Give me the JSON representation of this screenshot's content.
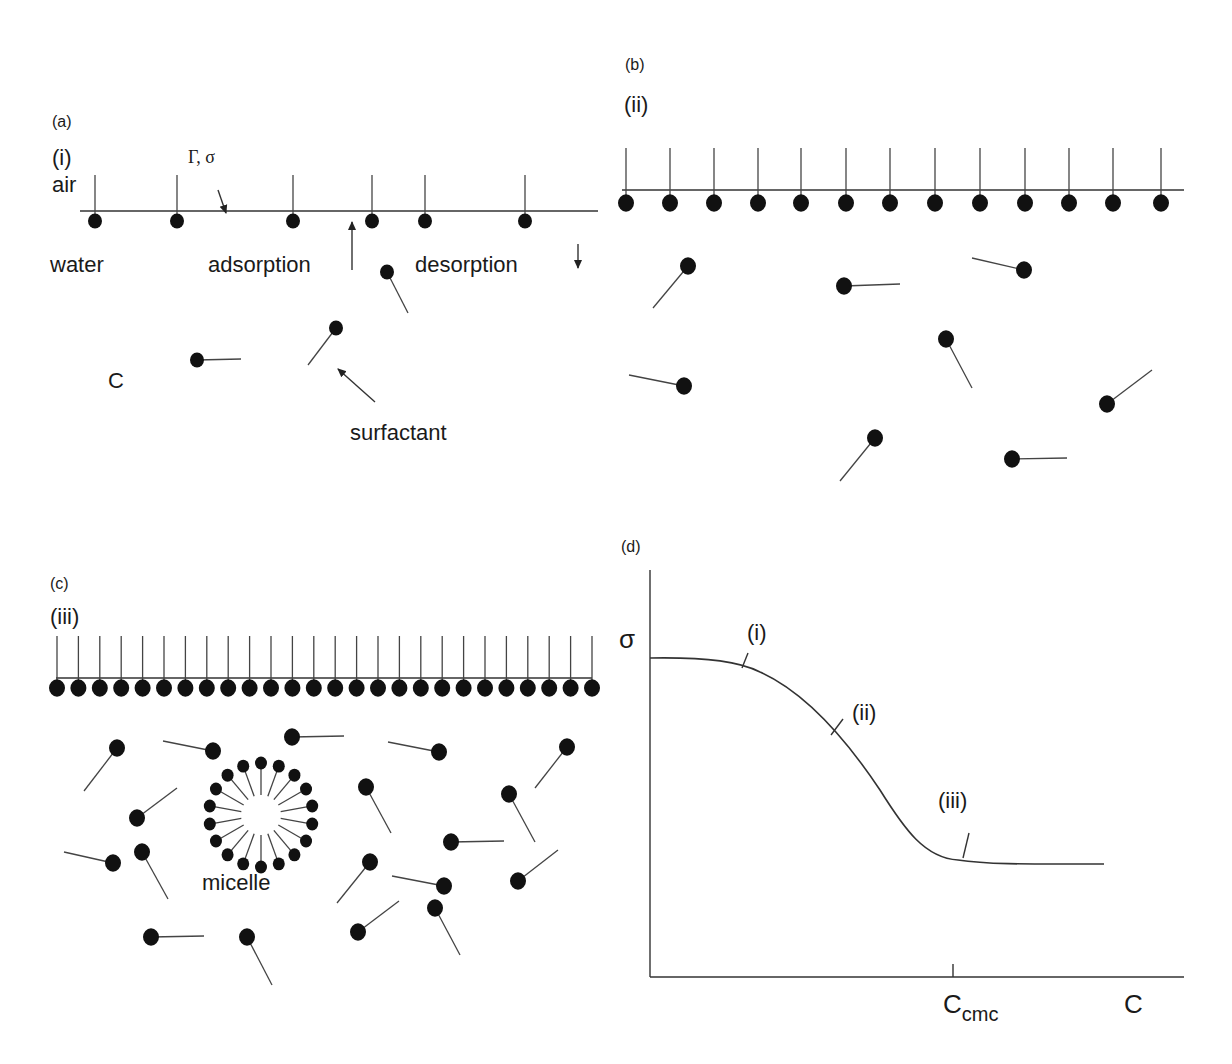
{
  "panels": {
    "a": {
      "label": "(a)",
      "label_pos": [
        52,
        127
      ],
      "sub_label": "(i)",
      "sub_label_pos": [
        52,
        165
      ],
      "air": {
        "text": "air",
        "pos": [
          52,
          192
        ]
      },
      "water": {
        "text": "water",
        "pos": [
          50,
          272
        ]
      },
      "gamma_sigma": {
        "text": "Γ, σ",
        "pos": [
          188,
          163
        ]
      },
      "adsorption": {
        "text": "adsorption",
        "pos": [
          208,
          272
        ]
      },
      "desorption": {
        "text": "desorption",
        "pos": [
          415,
          272
        ]
      },
      "conc": {
        "text": "C",
        "pos": [
          108,
          388
        ]
      },
      "surfactant": {
        "text": "surfactant",
        "pos": [
          350,
          440
        ]
      },
      "interface": {
        "x1": 80,
        "x2": 598,
        "y": 211
      },
      "adsorbed_heads_y": 221,
      "adsorbed": [
        95,
        177,
        293,
        372,
        425,
        525
      ],
      "tail_top_y": 175,
      "free": [
        {
          "hx": 387,
          "hy": 272,
          "tx": 408,
          "ty": 313
        },
        {
          "hx": 336,
          "hy": 328,
          "tx": 308,
          "ty": 365
        },
        {
          "hx": 197,
          "hy": 360,
          "tx": 241,
          "ty": 359
        }
      ],
      "arrows": [
        {
          "name": "gamma-sigma-pointer",
          "x1": 218,
          "y1": 190,
          "x2": 226,
          "y2": 213
        },
        {
          "name": "adsorption-arrow",
          "x1": 352,
          "y1": 270,
          "x2": 352,
          "y2": 222
        },
        {
          "name": "desorption-arrow",
          "x1": 578,
          "y1": 244,
          "x2": 578,
          "y2": 268
        },
        {
          "name": "surfactant-pointer",
          "x1": 375,
          "y1": 402,
          "x2": 338,
          "y2": 369
        }
      ]
    },
    "b": {
      "label": "(b)",
      "label_pos": [
        625,
        70
      ],
      "sub_label": "(ii)",
      "sub_label_pos": [
        624,
        112
      ],
      "interface": {
        "x1": 622,
        "x2": 1108,
        "y": 190
      },
      "interface_end": {
        "x": 1108,
        "y": 190,
        "x2": 1184,
        "y2": 190
      },
      "adsorbed_heads_y": 203,
      "adsorbed": [
        626,
        670,
        714,
        758,
        801,
        846,
        890,
        935,
        980,
        1025,
        1069,
        1113,
        1161
      ],
      "tail_top_y": 148,
      "free": [
        {
          "hx": 688,
          "hy": 266,
          "tx": 653,
          "ty": 308
        },
        {
          "hx": 844,
          "hy": 286,
          "tx": 900,
          "ty": 284
        },
        {
          "hx": 1024,
          "hy": 270,
          "tx": 972,
          "ty": 258
        },
        {
          "hx": 946,
          "hy": 339,
          "tx": 972,
          "ty": 388
        },
        {
          "hx": 684,
          "hy": 386,
          "tx": 629,
          "ty": 375
        },
        {
          "hx": 1107,
          "hy": 404,
          "tx": 1152,
          "ty": 370
        },
        {
          "hx": 875,
          "hy": 438,
          "tx": 840,
          "ty": 481
        },
        {
          "hx": 1012,
          "hy": 459,
          "tx": 1067,
          "ty": 458
        }
      ]
    },
    "c": {
      "label": "(c)",
      "label_pos": [
        50,
        589
      ],
      "sub_label": "(iii)",
      "sub_label_pos": [
        50,
        624
      ],
      "micelle_label": {
        "text": "micelle",
        "pos": [
          202,
          890
        ]
      },
      "interface": {
        "x1": 56,
        "x2": 592,
        "y": 678
      },
      "adsorbed_heads_y": 688,
      "adsorbed_start": 57,
      "adsorbed_step": 21.4,
      "adsorbed_count": 26,
      "tail_top_y": 636,
      "micelle": {
        "cx": 261,
        "cy": 815,
        "r_inner": 20,
        "r_tail": 46,
        "r_head": 52,
        "count": 18
      },
      "free": [
        {
          "hx": 117,
          "hy": 748,
          "tx": 84,
          "ty": 791
        },
        {
          "hx": 213,
          "hy": 751,
          "tx": 163,
          "ty": 741
        },
        {
          "hx": 292,
          "hy": 737,
          "tx": 344,
          "ty": 736
        },
        {
          "hx": 439,
          "hy": 752,
          "tx": 388,
          "ty": 742
        },
        {
          "hx": 567,
          "hy": 747,
          "tx": 535,
          "ty": 788
        },
        {
          "hx": 366,
          "hy": 787,
          "tx": 391,
          "ty": 833
        },
        {
          "hx": 509,
          "hy": 794,
          "tx": 535,
          "ty": 842
        },
        {
          "hx": 137,
          "hy": 818,
          "tx": 177,
          "ty": 788
        },
        {
          "hx": 451,
          "hy": 842,
          "tx": 504,
          "ty": 841
        },
        {
          "hx": 142,
          "hy": 852,
          "tx": 168,
          "ty": 899
        },
        {
          "hx": 113,
          "hy": 863,
          "tx": 64,
          "ty": 852
        },
        {
          "hx": 370,
          "hy": 862,
          "tx": 337,
          "ty": 903
        },
        {
          "hx": 444,
          "hy": 886,
          "tx": 392,
          "ty": 876
        },
        {
          "hx": 518,
          "hy": 881,
          "tx": 558,
          "ty": 850
        },
        {
          "hx": 435,
          "hy": 908,
          "tx": 460,
          "ty": 955
        },
        {
          "hx": 358,
          "hy": 932,
          "tx": 399,
          "ty": 901
        },
        {
          "hx": 151,
          "hy": 937,
          "tx": 204,
          "ty": 936
        },
        {
          "hx": 247,
          "hy": 937,
          "tx": 272,
          "ty": 985
        }
      ]
    },
    "d": {
      "label": "(d)",
      "label_pos": [
        621,
        552
      ],
      "sigma": {
        "text": "σ",
        "pos": [
          619,
          648
        ]
      },
      "label_i": {
        "text": "(i)",
        "pos": [
          747,
          640
        ]
      },
      "label_ii": {
        "text": "(ii)",
        "pos": [
          852,
          720
        ]
      },
      "label_iii": {
        "text": "(iii)",
        "pos": [
          938,
          808
        ]
      },
      "c_cmc": {
        "base": "C",
        "sub": "cmc",
        "pos": [
          943,
          1013
        ]
      },
      "c_axis": {
        "text": "C",
        "pos": [
          1124,
          1013
        ]
      }
    }
  },
  "chart_data": {
    "type": "line",
    "title": "(d)",
    "xlabel": "C",
    "ylabel": "σ",
    "annotations": [
      "(i)",
      "(ii)",
      "(iii)",
      "Ccmc"
    ],
    "x": [
      0,
      0.1,
      0.2,
      0.3,
      0.4,
      0.5,
      0.6,
      0.65,
      0.7,
      0.8,
      0.85,
      0.95,
      1.0
    ],
    "values": [
      1.0,
      0.99,
      0.95,
      0.85,
      0.7,
      0.52,
      0.36,
      0.32,
      0.31,
      0.3,
      0.3,
      0.3,
      0.3
    ],
    "cmc_x": 0.65,
    "grid": false,
    "axes_px": {
      "x0": 650,
      "y0": 977,
      "x1": 1184,
      "ytop": 570
    },
    "curve_px": "M650,658 C710,657 740,662 760,672 C800,690 840,730 880,790 C905,830 925,858 958,860 C990,865 1040,864 1104,864",
    "cmc_tick_px": {
      "x": 953,
      "y1": 964,
      "y2": 977
    },
    "pointers_px": [
      {
        "x1": 742,
        "y1": 668,
        "x2": 748,
        "y2": 653
      },
      {
        "x1": 831,
        "y1": 735,
        "x2": 843,
        "y2": 719
      },
      {
        "x1": 963,
        "y1": 858,
        "x2": 969,
        "y2": 833
      }
    ]
  }
}
